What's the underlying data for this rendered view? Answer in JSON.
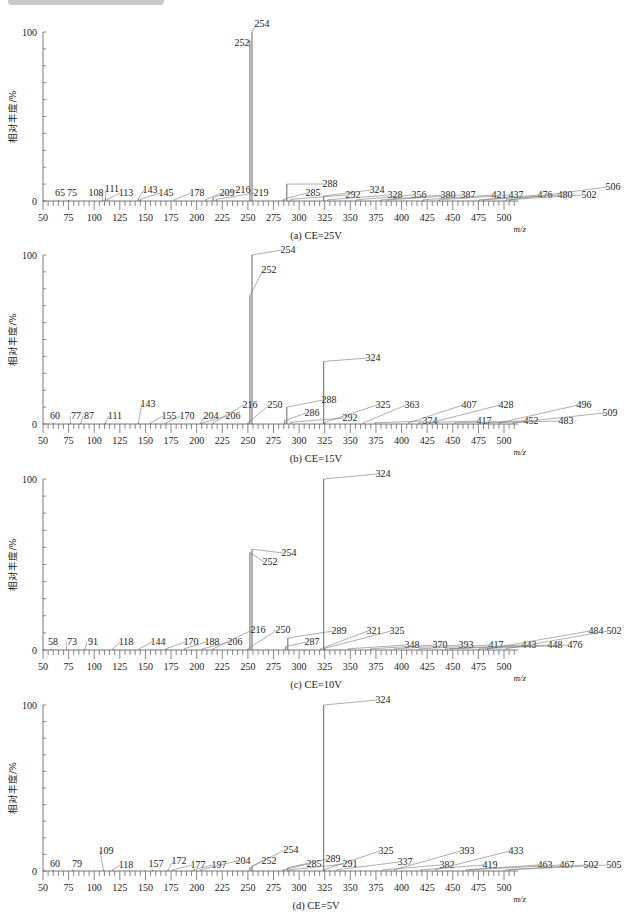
{
  "page": {
    "y_axis_label": "相对丰度/%",
    "x_axis_label": "m/z",
    "y_ticks": [
      "100",
      "0"
    ],
    "x_ticks": [
      50,
      75,
      100,
      125,
      150,
      175,
      200,
      225,
      250,
      275,
      300,
      325,
      350,
      375,
      400,
      425,
      450,
      475,
      500
    ]
  },
  "chart_data": [
    {
      "type": "bar",
      "title": "(a) CE=25V",
      "xlabel": "m/z",
      "ylabel": "相对丰度/%",
      "xlim": [
        50,
        510
      ],
      "ylim": [
        0,
        100
      ],
      "peaks": [
        {
          "mz": 65,
          "y": 0.5
        },
        {
          "mz": 75,
          "y": 0.5
        },
        {
          "mz": 108,
          "y": 0.8
        },
        {
          "mz": 111,
          "y": 2
        },
        {
          "mz": 113,
          "y": 1
        },
        {
          "mz": 143,
          "y": 1.5
        },
        {
          "mz": 145,
          "y": 1
        },
        {
          "mz": 178,
          "y": 0.5
        },
        {
          "mz": 209,
          "y": 0.8
        },
        {
          "mz": 216,
          "y": 2
        },
        {
          "mz": 219,
          "y": 1
        },
        {
          "mz": 252,
          "y": 95
        },
        {
          "mz": 254,
          "y": 100
        },
        {
          "mz": 285,
          "y": 1
        },
        {
          "mz": 288,
          "y": 10
        },
        {
          "mz": 292,
          "y": 1
        },
        {
          "mz": 324,
          "y": 3
        },
        {
          "mz": 328,
          "y": 0.5
        },
        {
          "mz": 356,
          "y": 0.5
        },
        {
          "mz": 380,
          "y": 0.5
        },
        {
          "mz": 387,
          "y": 0.5
        },
        {
          "mz": 421,
          "y": 0.5
        },
        {
          "mz": 437,
          "y": 0.5
        },
        {
          "mz": 476,
          "y": 0.5
        },
        {
          "mz": 480,
          "y": 0.5
        },
        {
          "mz": 502,
          "y": 0.5
        },
        {
          "mz": 506,
          "y": 0.5
        }
      ],
      "labels": [
        {
          "text": "65",
          "x": 60,
          "y": 196
        },
        {
          "text": "75",
          "x": 72,
          "y": 196
        },
        {
          "text": "108",
          "x": 96,
          "y": 196
        },
        {
          "text": "111",
          "x": 112,
          "y": 192
        },
        {
          "text": "113",
          "x": 126,
          "y": 196
        },
        {
          "text": "143",
          "x": 150,
          "y": 193
        },
        {
          "text": "145",
          "x": 166,
          "y": 196
        },
        {
          "text": "178",
          "x": 197,
          "y": 196
        },
        {
          "text": "209",
          "x": 227,
          "y": 196
        },
        {
          "text": "216",
          "x": 243,
          "y": 193
        },
        {
          "text": "219",
          "x": 261,
          "y": 196
        },
        {
          "text": "252",
          "x": 242,
          "y": 46
        },
        {
          "text": "254",
          "x": 262,
          "y": 27
        },
        {
          "text": "285",
          "x": 313,
          "y": 196
        },
        {
          "text": "288",
          "x": 330,
          "y": 187
        },
        {
          "text": "292",
          "x": 353,
          "y": 198
        },
        {
          "text": "324",
          "x": 377,
          "y": 193
        },
        {
          "text": "328",
          "x": 395,
          "y": 198
        },
        {
          "text": "356",
          "x": 419,
          "y": 198
        },
        {
          "text": "380",
          "x": 448,
          "y": 198
        },
        {
          "text": "387",
          "x": 468,
          "y": 198
        },
        {
          "text": "421",
          "x": 499,
          "y": 198
        },
        {
          "text": "437",
          "x": 516,
          "y": 198
        },
        {
          "text": "476",
          "x": 545,
          "y": 198
        },
        {
          "text": "480",
          "x": 565,
          "y": 198
        },
        {
          "text": "502",
          "x": 589,
          "y": 198
        },
        {
          "text": "506",
          "x": 613,
          "y": 190
        }
      ]
    },
    {
      "type": "bar",
      "title": "(b) CE=15V",
      "xlabel": "m/z",
      "ylabel": "相对丰度/%",
      "xlim": [
        50,
        510
      ],
      "ylim": [
        0,
        100
      ],
      "peaks": [
        {
          "mz": 60,
          "y": 0.5
        },
        {
          "mz": 77,
          "y": 0.5
        },
        {
          "mz": 87,
          "y": 0.5
        },
        {
          "mz": 111,
          "y": 0.5
        },
        {
          "mz": 143,
          "y": 0.5
        },
        {
          "mz": 155,
          "y": 0.5
        },
        {
          "mz": 170,
          "y": 0.5
        },
        {
          "mz": 204,
          "y": 0.5
        },
        {
          "mz": 206,
          "y": 0.5
        },
        {
          "mz": 216,
          "y": 0.5
        },
        {
          "mz": 250,
          "y": 0.5
        },
        {
          "mz": 252,
          "y": 76
        },
        {
          "mz": 254,
          "y": 100
        },
        {
          "mz": 286,
          "y": 2
        },
        {
          "mz": 288,
          "y": 10
        },
        {
          "mz": 292,
          "y": 1
        },
        {
          "mz": 324,
          "y": 37
        },
        {
          "mz": 325,
          "y": 1
        },
        {
          "mz": 363,
          "y": 0.5
        },
        {
          "mz": 374,
          "y": 0.5
        },
        {
          "mz": 407,
          "y": 0.5
        },
        {
          "mz": 417,
          "y": 0.5
        },
        {
          "mz": 428,
          "y": 0.5
        },
        {
          "mz": 452,
          "y": 0.5
        },
        {
          "mz": 483,
          "y": 0.5
        },
        {
          "mz": 496,
          "y": 0.5
        },
        {
          "mz": 509,
          "y": 0.5
        }
      ],
      "labels": [
        {
          "text": "60",
          "x": 55,
          "y": 419
        },
        {
          "text": "77",
          "x": 76,
          "y": 419
        },
        {
          "text": "87",
          "x": 89,
          "y": 419
        },
        {
          "text": "111",
          "x": 115,
          "y": 419
        },
        {
          "text": "143",
          "x": 148,
          "y": 407
        },
        {
          "text": "155",
          "x": 169,
          "y": 419
        },
        {
          "text": "170",
          "x": 187,
          "y": 419
        },
        {
          "text": "204",
          "x": 211,
          "y": 419
        },
        {
          "text": "206",
          "x": 233,
          "y": 419
        },
        {
          "text": "216",
          "x": 250,
          "y": 408
        },
        {
          "text": "250",
          "x": 275,
          "y": 408
        },
        {
          "text": "252",
          "x": 269,
          "y": 273
        },
        {
          "text": "254",
          "x": 288,
          "y": 253
        },
        {
          "text": "286",
          "x": 312,
          "y": 416
        },
        {
          "text": "288",
          "x": 329,
          "y": 403
        },
        {
          "text": "292",
          "x": 350,
          "y": 421
        },
        {
          "text": "324",
          "x": 373,
          "y": 361
        },
        {
          "text": "325",
          "x": 383,
          "y": 408
        },
        {
          "text": "363",
          "x": 412,
          "y": 408
        },
        {
          "text": "374",
          "x": 430,
          "y": 424
        },
        {
          "text": "407",
          "x": 469,
          "y": 408
        },
        {
          "text": "417",
          "x": 484,
          "y": 424
        },
        {
          "text": "428",
          "x": 506,
          "y": 408
        },
        {
          "text": "452",
          "x": 531,
          "y": 424
        },
        {
          "text": "483",
          "x": 566,
          "y": 424
        },
        {
          "text": "496",
          "x": 584,
          "y": 408
        },
        {
          "text": "509",
          "x": 610,
          "y": 416
        }
      ]
    },
    {
      "type": "bar",
      "title": "(c) CE=10V",
      "xlabel": "m/z",
      "ylabel": "相对丰度/%",
      "xlim": [
        50,
        510
      ],
      "ylim": [
        0,
        100
      ],
      "peaks": [
        {
          "mz": 58,
          "y": 0.5
        },
        {
          "mz": 73,
          "y": 0.5
        },
        {
          "mz": 91,
          "y": 0.5
        },
        {
          "mz": 118,
          "y": 0.5
        },
        {
          "mz": 144,
          "y": 0.5
        },
        {
          "mz": 170,
          "y": 0.5
        },
        {
          "mz": 188,
          "y": 0.5
        },
        {
          "mz": 206,
          "y": 0.5
        },
        {
          "mz": 216,
          "y": 0.5
        },
        {
          "mz": 250,
          "y": 0.5
        },
        {
          "mz": 252,
          "y": 57
        },
        {
          "mz": 254,
          "y": 59
        },
        {
          "mz": 287,
          "y": 2
        },
        {
          "mz": 289,
          "y": 7
        },
        {
          "mz": 321,
          "y": 0.5
        },
        {
          "mz": 324,
          "y": 100
        },
        {
          "mz": 325,
          "y": 1
        },
        {
          "mz": 348,
          "y": 0.5
        },
        {
          "mz": 370,
          "y": 0.5
        },
        {
          "mz": 393,
          "y": 0.5
        },
        {
          "mz": 417,
          "y": 0.5
        },
        {
          "mz": 443,
          "y": 0.5
        },
        {
          "mz": 448,
          "y": 0.5
        },
        {
          "mz": 476,
          "y": 0.5
        },
        {
          "mz": 484,
          "y": 0.5
        },
        {
          "mz": 502,
          "y": 0.5
        }
      ],
      "labels": [
        {
          "text": "58",
          "x": 53,
          "y": 645
        },
        {
          "text": "73",
          "x": 72,
          "y": 645
        },
        {
          "text": "91",
          "x": 93,
          "y": 645
        },
        {
          "text": "118",
          "x": 126,
          "y": 645
        },
        {
          "text": "144",
          "x": 158,
          "y": 645
        },
        {
          "text": "170",
          "x": 191,
          "y": 645
        },
        {
          "text": "188",
          "x": 212,
          "y": 645
        },
        {
          "text": "206",
          "x": 235,
          "y": 645
        },
        {
          "text": "216",
          "x": 258,
          "y": 633
        },
        {
          "text": "250",
          "x": 283,
          "y": 633
        },
        {
          "text": "252",
          "x": 270,
          "y": 565
        },
        {
          "text": "254",
          "x": 289,
          "y": 556
        },
        {
          "text": "287",
          "x": 312,
          "y": 645
        },
        {
          "text": "289",
          "x": 339,
          "y": 634
        },
        {
          "text": "321",
          "x": 374,
          "y": 634
        },
        {
          "text": "325",
          "x": 397,
          "y": 634
        },
        {
          "text": "324",
          "x": 383,
          "y": 477
        },
        {
          "text": "348",
          "x": 412,
          "y": 648
        },
        {
          "text": "370",
          "x": 440,
          "y": 648
        },
        {
          "text": "393",
          "x": 466,
          "y": 648
        },
        {
          "text": "417",
          "x": 496,
          "y": 648
        },
        {
          "text": "443",
          "x": 529,
          "y": 648
        },
        {
          "text": "448",
          "x": 555,
          "y": 648
        },
        {
          "text": "476",
          "x": 575,
          "y": 648
        },
        {
          "text": "484",
          "x": 596,
          "y": 634
        },
        {
          "text": "502",
          "x": 614,
          "y": 634
        }
      ]
    },
    {
      "type": "bar",
      "title": "(d) CE=5V",
      "xlabel": "m/z",
      "ylabel": "相对丰度/%",
      "xlim": [
        50,
        510
      ],
      "ylim": [
        0,
        100
      ],
      "peaks": [
        {
          "mz": 60,
          "y": 0.5
        },
        {
          "mz": 79,
          "y": 0.5
        },
        {
          "mz": 109,
          "y": 0.5
        },
        {
          "mz": 118,
          "y": 0.5
        },
        {
          "mz": 157,
          "y": 0.5
        },
        {
          "mz": 172,
          "y": 0.5
        },
        {
          "mz": 177,
          "y": 0.5
        },
        {
          "mz": 197,
          "y": 0.5
        },
        {
          "mz": 204,
          "y": 0.5
        },
        {
          "mz": 252,
          "y": 2
        },
        {
          "mz": 254,
          "y": 3
        },
        {
          "mz": 285,
          "y": 0.5
        },
        {
          "mz": 289,
          "y": 2
        },
        {
          "mz": 291,
          "y": 0.5
        },
        {
          "mz": 324,
          "y": 100
        },
        {
          "mz": 325,
          "y": 1
        },
        {
          "mz": 337,
          "y": 0.5
        },
        {
          "mz": 382,
          "y": 0.5
        },
        {
          "mz": 393,
          "y": 0.5
        },
        {
          "mz": 419,
          "y": 0.5
        },
        {
          "mz": 433,
          "y": 0.5
        },
        {
          "mz": 463,
          "y": 0.5
        },
        {
          "mz": 467,
          "y": 0.5
        },
        {
          "mz": 502,
          "y": 0.5
        },
        {
          "mz": 505,
          "y": 0.5
        }
      ],
      "labels": [
        {
          "text": "60",
          "x": 55,
          "y": 867
        },
        {
          "text": "79",
          "x": 77,
          "y": 867
        },
        {
          "text": "109",
          "x": 106,
          "y": 854
        },
        {
          "text": "118",
          "x": 126,
          "y": 868
        },
        {
          "text": "157",
          "x": 156,
          "y": 867
        },
        {
          "text": "172",
          "x": 179,
          "y": 864
        },
        {
          "text": "177",
          "x": 198,
          "y": 868
        },
        {
          "text": "197",
          "x": 219,
          "y": 868
        },
        {
          "text": "204",
          "x": 243,
          "y": 864
        },
        {
          "text": "252",
          "x": 269,
          "y": 864
        },
        {
          "text": "254",
          "x": 291,
          "y": 853
        },
        {
          "text": "285",
          "x": 314,
          "y": 867
        },
        {
          "text": "289",
          "x": 333,
          "y": 862
        },
        {
          "text": "291",
          "x": 350,
          "y": 867
        },
        {
          "text": "324",
          "x": 383,
          "y": 703
        },
        {
          "text": "325",
          "x": 386,
          "y": 854
        },
        {
          "text": "337",
          "x": 405,
          "y": 865
        },
        {
          "text": "382",
          "x": 447,
          "y": 868
        },
        {
          "text": "393",
          "x": 467,
          "y": 854
        },
        {
          "text": "419",
          "x": 490,
          "y": 868
        },
        {
          "text": "433",
          "x": 516,
          "y": 854
        },
        {
          "text": "463",
          "x": 545,
          "y": 868
        },
        {
          "text": "467",
          "x": 567,
          "y": 868
        },
        {
          "text": "502",
          "x": 591,
          "y": 868
        },
        {
          "text": "505",
          "x": 614,
          "y": 868
        }
      ]
    }
  ]
}
